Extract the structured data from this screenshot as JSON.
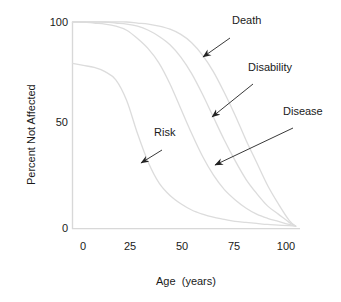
{
  "chart_data": {
    "type": "line",
    "title": "",
    "xlabel": "Age  (years)",
    "ylabel": "Percent Not Affected",
    "xlim": [
      0,
      105
    ],
    "ylim": [
      0,
      100
    ],
    "xticks": [
      0,
      25,
      50,
      75,
      100
    ],
    "xtick_labels": [
      "0",
      "25",
      "50",
      "75",
      "100"
    ],
    "yticks": [
      0,
      50,
      100
    ],
    "ytick_labels": [
      "0",
      "50",
      "100"
    ],
    "grid": false,
    "legend_position": "annotations-on-curves",
    "line_color": "#dcdcdc",
    "axis_color": "#d8d8d8",
    "text_color": "#1a1a1a",
    "arrow_color": "#222222",
    "x": [
      0,
      5,
      10,
      15,
      20,
      25,
      30,
      35,
      40,
      45,
      50,
      55,
      60,
      65,
      70,
      75,
      80,
      85,
      90,
      95,
      100,
      103
    ],
    "series": [
      {
        "name": "Risk",
        "values": [
          80,
          79,
          78,
          76,
          72,
          62,
          46,
          32,
          22,
          16,
          12,
          9,
          7,
          5.5,
          4.5,
          3.5,
          3,
          2.5,
          2,
          1.7,
          1.4,
          1.2
        ]
      },
      {
        "name": "Disease",
        "values": [
          100,
          100,
          99.5,
          99,
          98,
          96,
          92,
          87,
          80,
          70,
          58,
          46,
          35,
          26,
          19,
          14,
          10,
          7,
          5,
          3.5,
          2,
          1.2
        ]
      },
      {
        "name": "Disability",
        "values": [
          100,
          100,
          100,
          100,
          99.5,
          99,
          98,
          96,
          93,
          89,
          83,
          75,
          65,
          54,
          43,
          33,
          24,
          17,
          11,
          7,
          3,
          1.2
        ]
      },
      {
        "name": "Death",
        "values": [
          100,
          100,
          100,
          100,
          100,
          100,
          99.5,
          99,
          98,
          96.5,
          94,
          90,
          84,
          76,
          66,
          55,
          43,
          32,
          21,
          12,
          4,
          1.2
        ]
      }
    ],
    "annotations": [
      {
        "label": "Death",
        "label_x": 232,
        "label_y": 20,
        "arrow_from_x": 230,
        "arrow_from_y": 38,
        "arrow_to_x": 203,
        "arrow_to_y": 57
      },
      {
        "label": "Disability",
        "label_x": 248,
        "label_y": 67,
        "arrow_from_x": 253,
        "arrow_from_y": 84,
        "arrow_to_x": 212,
        "arrow_to_y": 117
      },
      {
        "label": "Disease",
        "label_x": 283,
        "label_y": 111,
        "arrow_from_x": 293,
        "arrow_from_y": 128,
        "arrow_to_x": 215,
        "arrow_to_y": 165
      },
      {
        "label": "Risk",
        "label_x": 154,
        "label_y": 132,
        "arrow_from_x": 162,
        "arrow_from_y": 150,
        "arrow_to_x": 141,
        "arrow_to_y": 163
      }
    ]
  }
}
